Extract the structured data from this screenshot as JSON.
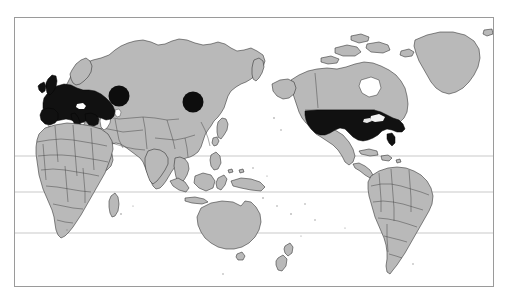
{
  "figure": {
    "type": "world-choropleth-map",
    "projection": "equirectangular",
    "frame": {
      "x": 14,
      "y": 17,
      "width": 480,
      "height": 270,
      "border_color": "#9a9a9a"
    },
    "background_color": "#ffffff",
    "land_color": "#b9b9b9",
    "highlight_color": "#111111",
    "coastline_color": "#2a2a2a",
    "gridline_color": "#b2b2b2"
  },
  "gridlines": {
    "orientation": "horizontal",
    "count": 3,
    "y_positions": [
      138,
      174,
      215
    ]
  },
  "highlighted_regions": [
    {
      "name": "western-europe",
      "label": "Western Europe",
      "style": "black-fill"
    },
    {
      "name": "united-states",
      "label": "United States",
      "style": "black-fill"
    }
  ],
  "markers": [
    {
      "name": "marker-central-russia",
      "cx": 104,
      "cy": 78,
      "r": 10.5,
      "color": "#0d0d0d"
    },
    {
      "name": "marker-east-asia",
      "cx": 178,
      "cy": 84,
      "r": 10.5,
      "color": "#0d0d0d"
    }
  ],
  "continents": [
    {
      "name": "eurasia",
      "fill": "land"
    },
    {
      "name": "africa",
      "fill": "land"
    },
    {
      "name": "north-america",
      "fill": "land"
    },
    {
      "name": "south-america",
      "fill": "land"
    },
    {
      "name": "australia",
      "fill": "land"
    },
    {
      "name": "greenland",
      "fill": "land"
    },
    {
      "name": "new-zealand",
      "fill": "land"
    },
    {
      "name": "madagascar",
      "fill": "land"
    },
    {
      "name": "indonesia",
      "fill": "land"
    },
    {
      "name": "japan",
      "fill": "land"
    },
    {
      "name": "british-isles",
      "fill": "highlight"
    }
  ]
}
